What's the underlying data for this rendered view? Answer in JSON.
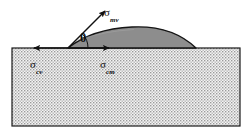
{
  "figure": {
    "name": "contact-angle-wetting-diagram",
    "width": 252,
    "height": 133,
    "background_color": "#ffffff"
  },
  "colors": {
    "background": "#ffffff",
    "substrate_fill": "#f2f2f2",
    "substrate_stipple": "#8f8f8f",
    "substrate_border": "#1a1a1a",
    "droplet_fill": "#8d8d8d",
    "droplet_border": "#151515",
    "arrow": "#111111",
    "text": "#111111"
  },
  "substrate": {
    "label": "crystal-substrate",
    "x": 12,
    "y": 48,
    "width": 228,
    "height": 78,
    "pattern": "stipple-dots",
    "dot_spacing": 3
  },
  "droplet": {
    "label": "melt-droplet",
    "contact_left_x": 68,
    "contact_right_x": 196,
    "baseline_y": 48,
    "apex_x": 132,
    "apex_y": 27
  },
  "vectors": [
    {
      "id": "sigma-mv",
      "symbol": "σ",
      "subscript": "mv",
      "meaning": "melt-vapor interfacial tension",
      "direction": "up-right diagonal",
      "from_x": 68,
      "from_y": 48,
      "to_x": 105,
      "to_y": 11
    },
    {
      "id": "sigma-cv",
      "symbol": "σ",
      "subscript": "cv",
      "meaning": "crystal-vapor interfacial tension",
      "direction": "left horizontal",
      "from_x": 68,
      "from_y": 48,
      "to_x": 34,
      "to_y": 48
    },
    {
      "id": "sigma-cm",
      "symbol": "σ",
      "subscript": "cm",
      "meaning": "crystal-melt interfacial tension",
      "direction": "right horizontal",
      "from_x": 68,
      "from_y": 48,
      "to_x": 109,
      "to_y": 48
    }
  ],
  "angle": {
    "id": "theta",
    "symbol": "θ",
    "meaning": "contact angle",
    "vertex_x": 68,
    "vertex_y": 48,
    "arc_radius": 20
  }
}
